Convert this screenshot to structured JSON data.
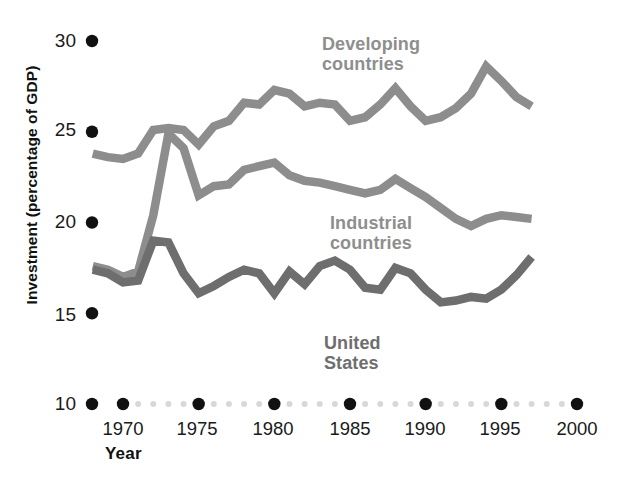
{
  "chart_data": {
    "type": "line",
    "title": "",
    "xlabel": "Year",
    "ylabel": "Investment (percentage of GDP)",
    "xlim": [
      1967,
      2001
    ],
    "ylim": [
      10,
      30
    ],
    "ytick_values": [
      30,
      25,
      20,
      15,
      10
    ],
    "ytick_labels": [
      "30",
      "25",
      "20",
      "15",
      "10"
    ],
    "xtick_values": [
      1970,
      1975,
      1980,
      1985,
      1990,
      1995,
      2000
    ],
    "xtick_labels": [
      "1970",
      "1975",
      "1980",
      "1985",
      "1990",
      "1995",
      "2000"
    ],
    "grid": false,
    "legend_position": "inline-annotations",
    "axis_style": "dotted-markers",
    "colors": {
      "developing": "#8d8d8d",
      "industrial": "#8d8d8d",
      "united_states": "#6e6e6e",
      "tick_dot_major": "#111111",
      "tick_dot_minor": "#d8d8d8",
      "text": "#111111"
    },
    "series": [
      {
        "name": "Developing countries",
        "color": "#8d8d8d",
        "x": [
          1968,
          1969,
          1970,
          1971,
          1972,
          1973,
          1974,
          1975,
          1976,
          1977,
          1978,
          1979,
          1980,
          1981,
          1982,
          1983,
          1984,
          1985,
          1986,
          1987,
          1988,
          1989,
          1990,
          1991,
          1992,
          1993,
          1994,
          1995,
          1996,
          1997
        ],
        "y": [
          23.8,
          23.6,
          23.5,
          23.8,
          25.1,
          25.2,
          25.1,
          24.3,
          25.3,
          25.6,
          26.6,
          26.5,
          27.3,
          27.1,
          26.4,
          26.6,
          26.5,
          25.6,
          25.8,
          26.5,
          27.4,
          26.4,
          25.6,
          25.8,
          26.3,
          27.1,
          28.6,
          27.8,
          26.9,
          26.4
        ]
      },
      {
        "name": "Industrial countries",
        "color": "#8d8d8d",
        "x": [
          1968,
          1969,
          1970,
          1971,
          1972,
          1973,
          1974,
          1975,
          1976,
          1977,
          1978,
          1979,
          1980,
          1981,
          1982,
          1983,
          1984,
          1985,
          1986,
          1987,
          1988,
          1989,
          1990,
          1991,
          1992,
          1993,
          1994,
          1995,
          1996,
          1997
        ],
        "y": [
          17.6,
          17.4,
          17.0,
          17.3,
          20.4,
          24.9,
          24.1,
          21.5,
          22.0,
          22.1,
          22.9,
          23.1,
          23.3,
          22.6,
          22.3,
          22.2,
          22.0,
          21.8,
          21.6,
          21.8,
          22.4,
          21.9,
          21.4,
          20.8,
          20.2,
          19.8,
          20.2,
          20.4,
          20.3,
          20.2
        ]
      },
      {
        "name": "United States",
        "color": "#6e6e6e",
        "x": [
          1968,
          1969,
          1970,
          1971,
          1972,
          1973,
          1974,
          1975,
          1976,
          1977,
          1978,
          1979,
          1980,
          1981,
          1982,
          1983,
          1984,
          1985,
          1986,
          1987,
          1988,
          1989,
          1990,
          1991,
          1992,
          1993,
          1994,
          1995,
          1996,
          1997
        ],
        "y": [
          17.4,
          17.2,
          16.7,
          16.8,
          19.0,
          18.9,
          17.2,
          16.1,
          16.5,
          17.0,
          17.4,
          17.2,
          16.1,
          17.3,
          16.6,
          17.6,
          17.9,
          17.4,
          16.4,
          16.3,
          17.5,
          17.2,
          16.3,
          15.6,
          15.7,
          15.9,
          15.8,
          16.3,
          17.1,
          18.1
        ]
      }
    ],
    "annotations": [
      {
        "text_line1": "Developing",
        "text_line2": "countries",
        "series": "Developing countries"
      },
      {
        "text_line1": "Industrial",
        "text_line2": "countries",
        "series": "Industrial countries"
      },
      {
        "text_line1": "United",
        "text_line2": "States",
        "series": "United States"
      }
    ]
  }
}
